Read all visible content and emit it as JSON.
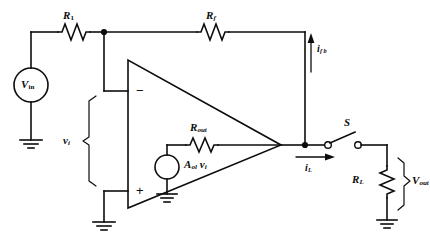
{
  "figure": {
    "type": "circuit-schematic",
    "background_color": "#ffffff",
    "line_color": "#0d0d0d"
  },
  "labels": {
    "r1": {
      "base": "R",
      "sub": "1"
    },
    "rf": {
      "base": "R",
      "sub": "f"
    },
    "rout": {
      "base": "R",
      "sub": "out"
    },
    "rload": {
      "base": "R",
      "sub": "L"
    },
    "vin": {
      "base": "V",
      "sub": "in"
    },
    "vout": {
      "base": "V",
      "sub": "out"
    },
    "vi": {
      "base": "v",
      "sub": "i"
    },
    "i_fb": {
      "base": "i",
      "sub": "f b"
    },
    "i_load": {
      "base": "i",
      "sub": "L"
    },
    "dependent_source": {
      "base": "A",
      "sub": "ol",
      "tail": "v",
      "tail_sub": "i"
    },
    "switch": {
      "base": "S",
      "sub": ""
    },
    "opamp_inverting": "−",
    "opamp_noninverting": "+"
  },
  "components": [
    {
      "name": "input-source",
      "kind": "voltage-source",
      "label": "V_in"
    },
    {
      "name": "input-resistor",
      "kind": "resistor",
      "label": "R_1"
    },
    {
      "name": "feedback-resistor",
      "kind": "resistor",
      "label": "R_f"
    },
    {
      "name": "output-resistor",
      "kind": "resistor",
      "label": "R_out"
    },
    {
      "name": "load-resistor",
      "kind": "resistor",
      "label": "R_L"
    },
    {
      "name": "dependent-source",
      "kind": "dependent-voltage-source",
      "label": "A_ol v_i"
    },
    {
      "name": "opamp",
      "kind": "operational-amplifier",
      "inputs": [
        "-",
        "+"
      ]
    },
    {
      "name": "load-switch",
      "kind": "spst-switch",
      "label": "S",
      "state": "open"
    }
  ],
  "currents": [
    {
      "name": "feedback-current",
      "label": "i_fb",
      "direction": "up"
    },
    {
      "name": "load-current",
      "label": "i_L",
      "direction": "right"
    }
  ],
  "nodes": [
    {
      "name": "summing-junction",
      "type": "junction-dot"
    },
    {
      "name": "output-node",
      "type": "junction-dot"
    }
  ],
  "grounds": [
    {
      "name": "source-ground"
    },
    {
      "name": "noninverting-ground"
    },
    {
      "name": "dependent-source-ground"
    },
    {
      "name": "load-ground"
    }
  ]
}
